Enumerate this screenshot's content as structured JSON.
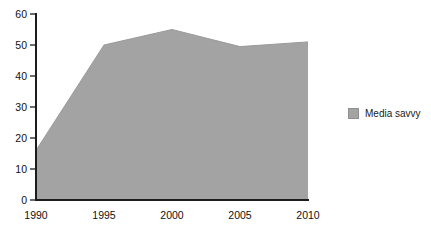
{
  "chart_data": {
    "type": "area",
    "title": "",
    "subtitle": "",
    "xlabel": "",
    "ylabel": "",
    "categories": [
      "1990",
      "1995",
      "2000",
      "2005",
      "2010"
    ],
    "x": [
      1990,
      1995,
      2000,
      2005,
      2010
    ],
    "series": [
      {
        "name": "Media savvy",
        "values": [
          16,
          50,
          55,
          49.5,
          51
        ],
        "color": "#a3a3a3"
      }
    ],
    "values": [
      16,
      50,
      55,
      49.5,
      51
    ],
    "ylim": [
      0,
      60
    ],
    "xlim": [
      1990,
      2010
    ],
    "yticks": [
      "0",
      "10",
      "20",
      "30",
      "40",
      "50",
      "60"
    ],
    "ytick_values": [
      0,
      10,
      20,
      30,
      40,
      50,
      60
    ],
    "xticks": [
      "1990",
      "1995",
      "2000",
      "2005",
      "2010"
    ],
    "grid": false,
    "legend_position": "right"
  },
  "legend": {
    "entries": [
      {
        "label": "Media savvy",
        "swatch_name": "legend-swatch-media-savvy",
        "color": "#a3a3a3"
      }
    ]
  },
  "axes": {
    "y_tick_labels": [
      "60",
      "50",
      "40",
      "30",
      "20",
      "10",
      "0"
    ],
    "x_tick_labels": [
      "1990",
      "1995",
      "2000",
      "2005",
      "2010"
    ],
    "axis_color": "#1c1c1c"
  }
}
